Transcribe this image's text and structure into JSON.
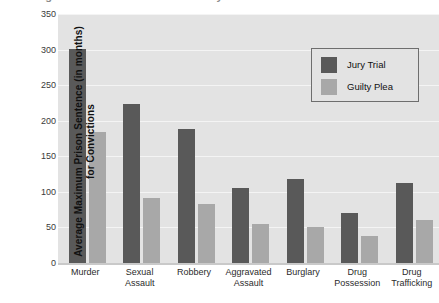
{
  "cut_title": "Average Maximum Prison Sentence by Offense",
  "axis": {
    "y_title_line1": "Average Maximum Prison Sentence (in months)",
    "y_title_line2": "for Convictions"
  },
  "colors": {
    "jury_trial": "#595959",
    "guilty_plea": "#a8a8a8",
    "panel_background": "#e3e3e3",
    "gridline": "#f4f4f4"
  },
  "legend": {
    "items": [
      {
        "label": "Jury Trial",
        "color": "#595959"
      },
      {
        "label": "Guilty Plea",
        "color": "#a8a8a8"
      }
    ]
  },
  "chart_data": {
    "type": "bar",
    "title": "",
    "xlabel": "",
    "ylabel": "Average Maximum Prison Sentence (in months) for Convictions",
    "ylim": [
      0,
      350
    ],
    "yticks": [
      0,
      50,
      100,
      150,
      200,
      250,
      300,
      350
    ],
    "ytick_labels": [
      "0",
      "50",
      "100",
      "150",
      "200",
      "250",
      "300",
      "350"
    ],
    "grid": true,
    "legend_position": "top-right",
    "categories": [
      "Murder",
      "Sexual Assault",
      "Robbery",
      "Aggravated Assault",
      "Burglary",
      "Drug Possession",
      "Drug Trafficking"
    ],
    "category_lines": [
      [
        "Murder",
        ""
      ],
      [
        "Sexual",
        "Assault"
      ],
      [
        "Robbery",
        ""
      ],
      [
        "Aggravated",
        "Assault"
      ],
      [
        "Burglary",
        ""
      ],
      [
        "Drug",
        "Possession"
      ],
      [
        "Drug",
        "Trafficking"
      ]
    ],
    "series": [
      {
        "name": "Jury Trial",
        "color": "#595959",
        "values": [
          301,
          224,
          189,
          106,
          118,
          70,
          113
        ]
      },
      {
        "name": "Guilty Plea",
        "color": "#a8a8a8",
        "values": [
          184,
          92,
          83,
          55,
          50,
          38,
          61
        ]
      }
    ]
  }
}
